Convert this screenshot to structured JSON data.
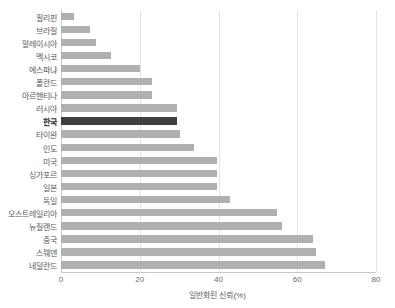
{
  "chart_data": {
    "type": "bar",
    "orientation": "horizontal",
    "title": "",
    "xlabel": "일반화된 신뢰(%)",
    "ylabel": "",
    "xlim": [
      0,
      80
    ],
    "xticks": [
      0,
      20,
      40,
      60,
      80
    ],
    "xtick_labels": [
      "0",
      "20",
      "40",
      "60",
      "80"
    ],
    "grid": "vertical",
    "legend": "none",
    "bar_color": "#b0b0b0",
    "highlight_color": "#3f3f3f",
    "highlight_category": "한국",
    "categories": [
      "필리핀",
      "브라질",
      "말레이시아",
      "멕시코",
      "에스파냐",
      "폴란드",
      "아르헨티나",
      "러시아",
      "한국",
      "타이완",
      "인도",
      "미국",
      "싱가포르",
      "일본",
      "독일",
      "오스트레일리아",
      "뉴질랜드",
      "중국",
      "스웨덴",
      "네덜란드"
    ],
    "values": [
      3.3,
      7.4,
      9.0,
      12.7,
      20.0,
      23.0,
      23.0,
      29.5,
      29.5,
      30.2,
      33.8,
      39.5,
      39.5,
      39.5,
      43.0,
      54.9,
      56.0,
      64.0,
      64.8,
      67.0
    ]
  }
}
